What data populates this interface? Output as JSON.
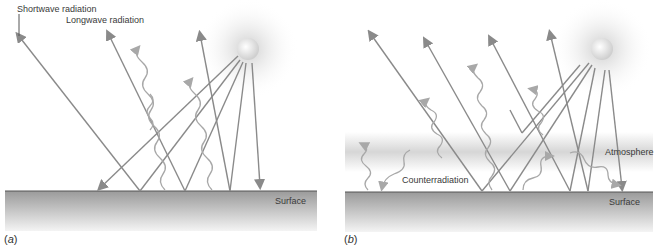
{
  "figure": {
    "panel_a": {
      "tag_open": "(",
      "tag_letter": "a",
      "tag_close": ")",
      "labels": {
        "shortwave": "Shortwave radiation",
        "longwave": "Longwave radiation",
        "surface": "Surface"
      }
    },
    "panel_b": {
      "tag_open": "(",
      "tag_letter": "b",
      "tag_close": ")",
      "labels": {
        "atmosphere": "Atmosphere",
        "counterradiation": "Counterradiation",
        "surface": "Surface"
      }
    },
    "colors": {
      "ray": "#8a8a8a",
      "wave": "#a8a8a8",
      "surface_top": "#9a9a9a",
      "surface_bottom": "#f2f2f2",
      "atmosphere_band": "#d8d8d8",
      "sun": "#e6e6e6"
    }
  }
}
